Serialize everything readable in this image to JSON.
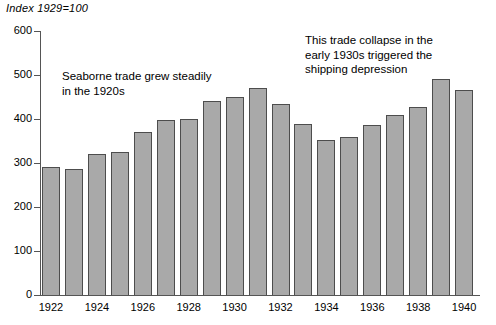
{
  "chart_data": {
    "type": "bar",
    "title": "Index 1929=100",
    "xlabel": "",
    "ylabel": "",
    "ylim": [
      0,
      600
    ],
    "ytick_values": [
      0,
      100,
      200,
      300,
      400,
      500,
      600
    ],
    "ytick_labels": [
      "0",
      "100",
      "200",
      "300",
      "400",
      "500",
      "600"
    ],
    "grid": false,
    "legend": null,
    "bar_color": "#a9a9a9",
    "bar_edge_color": "#4d4d4d",
    "axis_color": "#555555",
    "categories": [
      "1922",
      "1923",
      "1924",
      "1925",
      "1926",
      "1927",
      "1928",
      "1929",
      "1930",
      "1931",
      "1932",
      "1933",
      "1934",
      "1935",
      "1936",
      "1937",
      "1938",
      "1939",
      "1940"
    ],
    "xtick_labels": [
      "1922",
      "1924",
      "1926",
      "1928",
      "1930",
      "1932",
      "1934",
      "1936",
      "1938",
      "1940"
    ],
    "values": [
      291,
      287,
      320,
      326,
      370,
      397,
      400,
      440,
      450,
      470,
      435,
      389,
      352,
      358,
      386,
      409,
      428,
      490,
      465
    ],
    "annotations": [
      {
        "id": "left",
        "text": "Seaborne trade grew steadily\nin the 1920s"
      },
      {
        "id": "right",
        "text": "This trade collapse in the\nearly 1930s triggered the\nshipping depression"
      }
    ]
  }
}
